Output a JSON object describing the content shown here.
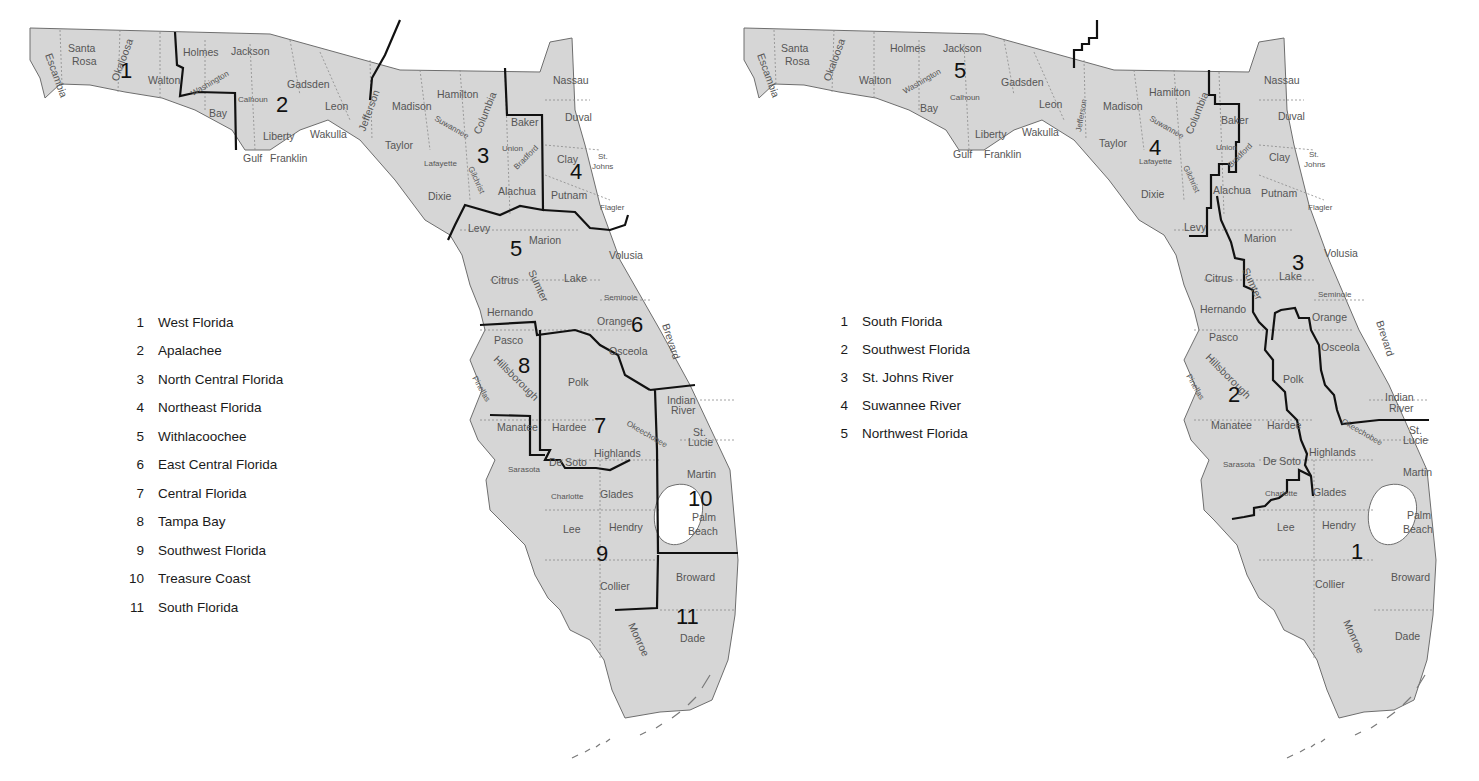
{
  "left_map": {
    "name": "Regional Planning Councils",
    "legend": [
      {
        "num": "1",
        "label": "West Florida"
      },
      {
        "num": "2",
        "label": "Apalachee"
      },
      {
        "num": "3",
        "label": "North Central Florida"
      },
      {
        "num": "4",
        "label": "Northeast Florida"
      },
      {
        "num": "5",
        "label": "Withlacoochee"
      },
      {
        "num": "6",
        "label": "East Central Florida"
      },
      {
        "num": "7",
        "label": "Central Florida"
      },
      {
        "num": "8",
        "label": "Tampa Bay"
      },
      {
        "num": "9",
        "label": "Southwest Florida"
      },
      {
        "num": "10",
        "label": "Treasure Coast"
      },
      {
        "num": "11",
        "label": "South Florida"
      }
    ],
    "region_numbers": [
      "1",
      "2",
      "3",
      "4",
      "5",
      "6",
      "7",
      "8",
      "9",
      "10",
      "11"
    ]
  },
  "right_map": {
    "name": "Water Management Districts",
    "legend": [
      {
        "num": "1",
        "label": "South Florida"
      },
      {
        "num": "2",
        "label": "Southwest Florida"
      },
      {
        "num": "3",
        "label": "St. Johns River"
      },
      {
        "num": "4",
        "label": "Suwannee River"
      },
      {
        "num": "5",
        "label": "Northwest Florida"
      }
    ],
    "region_numbers": [
      "1",
      "2",
      "3",
      "4",
      "5"
    ]
  },
  "counties": {
    "escambia": "Escambia",
    "santa_rosa_1": "Santa",
    "santa_rosa_2": "Rosa",
    "okaloosa": "Okaloosa",
    "walton": "Walton",
    "holmes": "Holmes",
    "jackson": "Jackson",
    "washington": "Washington",
    "bay": "Bay",
    "calhoun": "Calhoun",
    "gadsden": "Gadsden",
    "leon": "Leon",
    "liberty": "Liberty",
    "wakulla": "Wakulla",
    "gulf": "Gulf",
    "franklin": "Franklin",
    "jefferson": "Jefferson",
    "madison": "Madison",
    "hamilton": "Hamilton",
    "taylor": "Taylor",
    "suwannee": "Suwannee",
    "lafayette": "Lafayette",
    "columbia": "Columbia",
    "union": "Union",
    "bradford": "Bradford",
    "gilchrist": "Gilchrist",
    "dixie": "Dixie",
    "alachua": "Alachua",
    "baker": "Baker",
    "nassau": "Nassau",
    "duval": "Duval",
    "clay": "Clay",
    "st_johns_1": "St.",
    "st_johns_2": "Johns",
    "putnam": "Putnam",
    "flagler": "Flagler",
    "levy": "Levy",
    "marion": "Marion",
    "volusia": "Volusia",
    "citrus": "Citrus",
    "sumter": "Sumter",
    "lake": "Lake",
    "seminole": "Seminole",
    "hernando": "Hernando",
    "orange": "Orange",
    "brevard": "Brevard",
    "pasco": "Pasco",
    "osceola": "Osceola",
    "hillsborough": "Hillsborough",
    "pinellas": "Pinellas",
    "polk": "Polk",
    "indian_river_1": "Indian",
    "indian_river_2": "River",
    "manatee": "Manatee",
    "hardee": "Hardee",
    "okeechobee": "Okeechobee",
    "st_lucie_1": "St.",
    "st_lucie_2": "Lucie",
    "sarasota": "Sarasota",
    "de_soto": "De Soto",
    "highlands": "Highlands",
    "martin": "Martin",
    "charlotte": "Charlotte",
    "glades": "Glades",
    "palm_beach_1": "Palm",
    "palm_beach_2": "Beach",
    "lee": "Lee",
    "hendry": "Hendry",
    "collier": "Collier",
    "broward": "Broward",
    "monroe": "Monroe",
    "dade": "Dade"
  }
}
